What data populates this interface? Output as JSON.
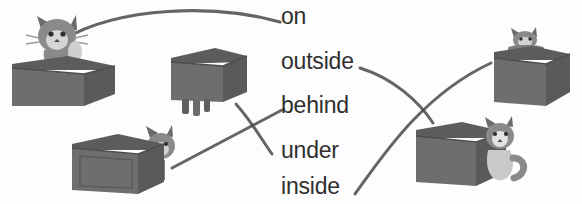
{
  "worksheet": {
    "type": "matching-exercise",
    "topic": "prepositions of place",
    "background_color": "#fdfdfd",
    "ink_color": "#2f2f2f",
    "box_color": "#6e6e6e",
    "box_color_dark": "#5a5a5a",
    "box_color_light": "#7d7d7d",
    "cat_color": "#777777",
    "cat_color_light": "#bdbdbd"
  },
  "words": [
    {
      "id": "on",
      "label": "on"
    },
    {
      "id": "outside",
      "label": "outside"
    },
    {
      "id": "behind",
      "label": "behind"
    },
    {
      "id": "under",
      "label": "under"
    },
    {
      "id": "inside",
      "label": "inside"
    }
  ],
  "illustrations": [
    {
      "id": "cat-in-box-top-left",
      "description": "cat sitting inside an open box",
      "matches": "on"
    },
    {
      "id": "box-with-legs-middle",
      "description": "box with cat legs sticking out underneath",
      "matches": "under"
    },
    {
      "id": "cat-behind-box-lower-left",
      "description": "cat peeking out from behind a box",
      "matches": "behind"
    },
    {
      "id": "cat-on-box-top-right",
      "description": "cat standing on top of a box",
      "matches": "inside"
    },
    {
      "id": "cat-beside-box-lower-right",
      "description": "cat sitting outside next to a box",
      "matches": "outside"
    }
  ],
  "connectors": [
    {
      "id": "connector-on",
      "from": "cat-in-box-top-left",
      "to": "on",
      "style": "arc"
    },
    {
      "id": "connector-outside",
      "from": "outside",
      "to": "cat-beside-box-lower-right",
      "style": "curve"
    },
    {
      "id": "connector-behind",
      "from": "cat-behind-box-lower-left",
      "to": "behind",
      "style": "straight"
    },
    {
      "id": "connector-under",
      "from": "box-with-legs-middle",
      "to": "under",
      "style": "curve"
    },
    {
      "id": "connector-inside",
      "from": "inside",
      "to": "cat-on-box-top-right",
      "style": "curve"
    }
  ]
}
